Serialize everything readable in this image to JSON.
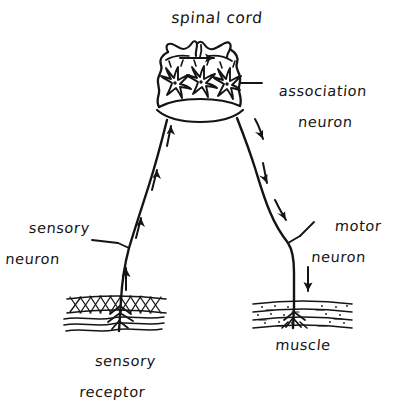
{
  "figure": {
    "background_color": "#ffffff",
    "ink_color": "#141414",
    "style": "hand-drawn line illustration"
  },
  "labels": {
    "spinal_cord": "spinal cord",
    "association_neuron_line1": "association",
    "association_neuron_line2": "neuron",
    "sensory_neuron_line1": "sensory",
    "sensory_neuron_line2": "neuron",
    "motor_neuron_line1": "motor",
    "motor_neuron_line2": "neuron",
    "sensory_receptor_line1": "sensory",
    "sensory_receptor_line2": "receptor",
    "muscle": "muscle"
  },
  "structures": [
    {
      "name": "spinal-cord",
      "label": "spinal cord",
      "description": "butterfly shaped gray matter cross-section at top of diagram"
    },
    {
      "name": "association-neuron",
      "label": "association neuron",
      "count": 3,
      "description": "three star-shaped multipolar interneuron cell bodies with nuclei inside the cord"
    },
    {
      "name": "sensory-neuron",
      "label": "sensory neuron",
      "description": "afferent axon running from sensory receptor up the left side into the cord"
    },
    {
      "name": "motor-neuron",
      "label": "motor neuron",
      "description": "efferent axon running from the cord down the right side to the muscle"
    },
    {
      "name": "sensory-receptor",
      "label": "sensory receptor",
      "description": "cross-hatched skin layer with branching nerve endings at lower left"
    },
    {
      "name": "muscle",
      "label": "muscle",
      "description": "striated speckled muscle band with motor end plate at lower right"
    }
  ],
  "flow_arrows": {
    "sensory_direction": "up",
    "sensory_arrow_count": 4,
    "motor_direction": "down",
    "motor_arrow_count": 4,
    "cord_arrow_direction": "right",
    "cord_arrow_count": 1
  }
}
